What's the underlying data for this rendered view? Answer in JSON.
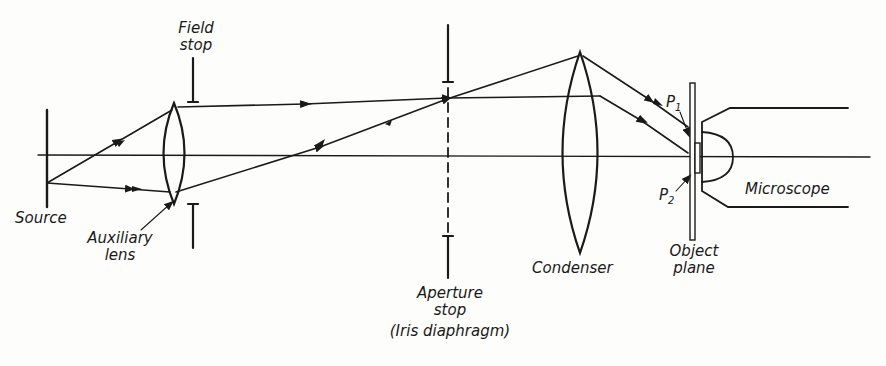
{
  "diagram": {
    "colors": {
      "ink": "#1a1a1a",
      "background": "#fdfdfb"
    },
    "labels": {
      "field_stop_line1": "Field",
      "field_stop_line2": "stop",
      "source": "Source",
      "auxiliary_lens_line1": "Auxiliary",
      "auxiliary_lens_line2": "lens",
      "aperture_stop_line1": "Aperture",
      "aperture_stop_line2": "stop",
      "aperture_stop_line3": "(Iris diaphragm)",
      "condenser": "Condenser",
      "object_plane_line1": "Object",
      "object_plane_line2": "plane",
      "microscope": "Microscope",
      "p1_main": "P",
      "p1_sub": "1",
      "p2_main": "P",
      "p2_sub": "2"
    },
    "components": [
      {
        "name": "Source",
        "type": "line-source",
        "x": 47
      },
      {
        "name": "Auxiliary lens",
        "type": "biconvex-lens",
        "x": 174
      },
      {
        "name": "Field stop",
        "type": "stop",
        "x": 193
      },
      {
        "name": "Aperture stop (Iris diaphragm)",
        "type": "stop-dashed",
        "x": 448
      },
      {
        "name": "Condenser",
        "type": "biconvex-lens",
        "x": 580
      },
      {
        "name": "Object plane",
        "type": "plane",
        "x": 692
      },
      {
        "name": "Microscope",
        "type": "objective",
        "x": 700
      }
    ],
    "points": [
      "P1",
      "P2"
    ]
  }
}
